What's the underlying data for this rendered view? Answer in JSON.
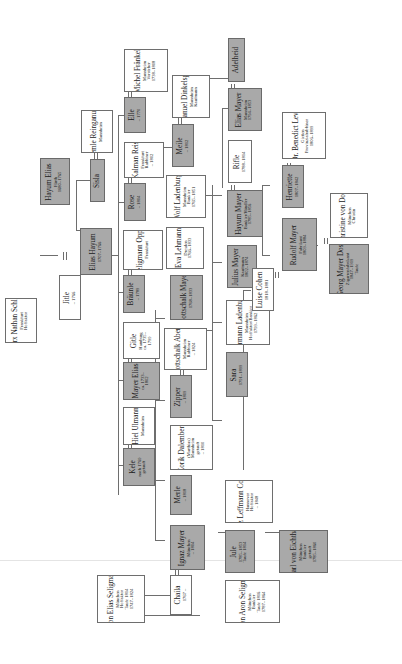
{
  "diagram": {
    "type": "family-tree",
    "orientation": "rotated-90-ccw",
    "colors": {
      "highlight_box": "#a9a9a9",
      "plain_box": "#ffffff",
      "line": "#6e6e6e"
    },
    "people": {
      "hayum_elias": {
        "name": "Hayum Elias",
        "lines": [
          "Fürth",
          "1680–1765"
        ],
        "highlight": true
      },
      "lemle": {
        "name": "Lemle Reinganum",
        "lines": [
          "Mannheim"
        ],
        "highlight": false
      },
      "sisla": {
        "name": "Sisla",
        "lines": [],
        "highlight": true
      },
      "elias_hayum": {
        "name": "Elias Hayum",
        "lines": [
          "1707–1766"
        ],
        "highlight": true
      },
      "marx": {
        "name": "Marx Nathan Schloss",
        "lines": [
          "Frankfurt",
          "Hoffaktor"
        ],
        "highlight": false
      },
      "jitle": {
        "name": "Jitle",
        "lines": [
          "– 1766"
        ],
        "highlight": false
      },
      "michel": {
        "name": "Michel Fränkel",
        "lines": [
          "Mannheim",
          "Vorsteher",
          "1738–1808"
        ],
        "highlight": false
      },
      "elle": {
        "name": "Elle",
        "lines": [
          "– 1770"
        ],
        "highlight": true
      },
      "kalman": {
        "name": "Kalman Reis",
        "lines": [
          "Frankfurt",
          "Rabbiner",
          "– 1802"
        ],
        "highlight": false
      },
      "rose": {
        "name": "Rose",
        "lines": [
          "– 1804"
        ],
        "highlight": true
      },
      "wolf_seligmann": {
        "name": "Wolf Seligmann Oppenheim",
        "lines": [
          "Frankfurt"
        ],
        "highlight": false
      },
      "braunle": {
        "name": "Bräunle",
        "lines": [
          "– 1789"
        ],
        "highlight": true
      },
      "gitle": {
        "name": "Gitle",
        "lines": [
          "Hamburg",
          "ca. 1735–",
          "1799"
        ],
        "highlight": false
      },
      "mayer_elias": {
        "name": "Mayer Elias",
        "lines": [
          "ca. 1733–",
          "1802"
        ],
        "highlight": true
      },
      "hiel": {
        "name": "Hiel Ulmann",
        "lines": [
          "Mannheim"
        ],
        "highlight": false
      },
      "kele": {
        "name": "Kele",
        "lines": [
          "nach 1769",
          "getauft"
        ],
        "highlight": true
      },
      "emanuel": {
        "name": "Emanuel Dinkelspiel",
        "lines": [
          "Mannheim",
          "Kaufmann"
        ],
        "highlight": false
      },
      "meile": {
        "name": "Meile",
        "lines": [
          "– 1812"
        ],
        "highlight": true
      },
      "wolf_ladenburg": {
        "name": "Wolf Ladenburg",
        "lines": [
          "Mannheim",
          "Bankier",
          "1765–1851"
        ],
        "highlight": false
      },
      "eva": {
        "name": "Eva Lehmann",
        "lines": [
          "Dresden",
          "1766–1833"
        ],
        "highlight": false
      },
      "gottschalk_mayer": {
        "name": "Gottschalk Mayer",
        "lines": [
          "1768–1833"
        ],
        "highlight": true
      },
      "gottschalk_abenz": {
        "name": "Gottschalk Abenz",
        "lines": [
          "Mannheim",
          "Rabbiner",
          "– 1824"
        ],
        "highlight": false
      },
      "zipper": {
        "name": "Zipper",
        "lines": [
          "– 1809"
        ],
        "highlight": true
      },
      "zorik": {
        "name": "Zorik Dalemberr",
        "lines": [
          "(Marthias)",
          "Mannheim",
          "getauft",
          "– 1810"
        ],
        "highlight": false
      },
      "merle": {
        "name": "Merle",
        "lines": [
          "– 1818"
        ],
        "highlight": true
      },
      "ignaz": {
        "name": "Ignaz Mayer",
        "lines": [
          "München",
          "– 1804"
        ],
        "highlight": true
      },
      "adelheid": {
        "name": "Adelheid",
        "lines": [],
        "highlight": true
      },
      "elias_mayer": {
        "name": "Elias Mayer",
        "lines": [
          "Mannheim",
          "1794–1853"
        ],
        "highlight": true
      },
      "rifle": {
        "name": "Rifle",
        "lines": [
          "1788–1814"
        ],
        "highlight": false
      },
      "hayum_mayer": {
        "name": "Hayum Mayer",
        "lines": [
          "Bankier/Händler",
          "1785–1856"
        ],
        "highlight": true
      },
      "julius": {
        "name": "Julius Mayer",
        "lines": [
          "Kaufmann",
          "1802–1874"
        ],
        "highlight": true
      },
      "hermann": {
        "name": "Hermann Ladenburg",
        "lines": [
          "Mannheim",
          "Hoffaktor/Bankier",
          "1799–1862"
        ],
        "highlight": false
      },
      "sara": {
        "name": "Sara",
        "lines": [
          "1791–1899"
        ],
        "highlight": true
      },
      "herz": {
        "name": "Herz Leffmann Cohen",
        "lines": [
          "Hannover",
          "Hoffaktor",
          "– 1848"
        ],
        "highlight": false
      },
      "benedict": {
        "name": "Dr. Benedict Levi",
        "lines": [
          "Gießen",
          "Provinzialrabbiner",
          "1806–1899"
        ],
        "highlight": false
      },
      "henriette": {
        "name": "Henriette",
        "lines": [
          "1807–1842"
        ],
        "highlight": true
      },
      "rudolf": {
        "name": "Rudolf Mayer",
        "lines": [
          "Fabrikant",
          "1809–1884"
        ],
        "highlight": true
      },
      "luise": {
        "name": "Luise Cohen",
        "lines": [
          "1818–1881"
        ],
        "highlight": false
      },
      "christine": {
        "name": "Christine von Doss",
        "lines": [
          "München",
          "Christin"
        ],
        "highlight": false
      },
      "georg": {
        "name": "Georg Mayer Doss",
        "lines": [
          "Zigarrenfabrikant",
          "1847–1919",
          "Taufe"
        ],
        "highlight": true
      },
      "jule": {
        "name": "Jule",
        "lines": [
          "1785–1853",
          "Taufe 1814"
        ],
        "highlight": true
      },
      "karl": {
        "name": "Karl von Eichthal",
        "lines": [
          "München",
          "Bankier",
          "getauft",
          "1785–1860"
        ],
        "highlight": true
      },
      "chaila": {
        "name": "Chaila",
        "lines": [
          "1767 –"
        ],
        "highlight": false
      },
      "aron": {
        "name": "Aron Elias Seligmann",
        "lines": [
          "München",
          "Hoffaktor",
          "Taufe 1814",
          "1747–1824"
        ],
        "highlight": false
      },
      "simon": {
        "name": "Simon Aron Seligmann",
        "lines": [
          "München",
          "Bankier",
          "Taufe 1816",
          "1787–1864"
        ],
        "highlight": false
      }
    }
  }
}
